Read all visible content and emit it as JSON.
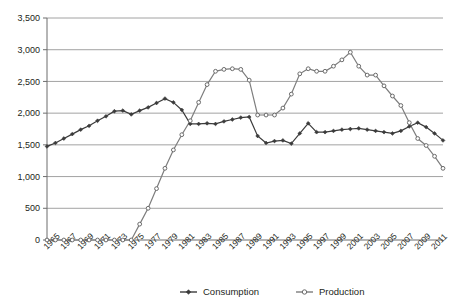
{
  "chart_data": {
    "type": "line",
    "title": "",
    "xlabel": "",
    "ylabel": "",
    "grid": true,
    "legend_position": "bottom",
    "ylim": [
      0,
      3500
    ],
    "yticks": [
      0,
      500,
      1000,
      1500,
      2000,
      2500,
      3000,
      3500
    ],
    "ytick_labels": [
      "0",
      "500",
      "1,000",
      "1,500",
      "2,000",
      "2,500",
      "3,000",
      "3,500"
    ],
    "x": [
      1965,
      1966,
      1967,
      1968,
      1969,
      1970,
      1971,
      1972,
      1973,
      1974,
      1975,
      1976,
      1977,
      1978,
      1979,
      1980,
      1981,
      1982,
      1983,
      1984,
      1985,
      1986,
      1987,
      1988,
      1989,
      1990,
      1991,
      1992,
      1993,
      1994,
      1995,
      1996,
      1997,
      1998,
      1999,
      2000,
      2001,
      2002,
      2003,
      2004,
      2005,
      2006,
      2007,
      2008,
      2009,
      2010,
      2011,
      2012
    ],
    "xtick_labels": [
      "1965",
      "1967",
      "1969",
      "1971",
      "1973",
      "1975",
      "1977",
      "1979",
      "1981",
      "1983",
      "1985",
      "1987",
      "1989",
      "1991",
      "1993",
      "1995",
      "1997",
      "1999",
      "2001",
      "2003",
      "2005",
      "2007",
      "2009",
      "2011"
    ],
    "series": [
      {
        "name": "Consumption",
        "marker": "filled-diamond",
        "color": "#3b3b3b",
        "values": [
          1475,
          1530,
          1600,
          1670,
          1740,
          1800,
          1880,
          1950,
          2030,
          2040,
          1980,
          2040,
          2090,
          2160,
          2230,
          2170,
          2050,
          1830,
          1830,
          1840,
          1830,
          1870,
          1900,
          1930,
          1940,
          1640,
          1530,
          1560,
          1570,
          1520,
          1680,
          1840,
          1700,
          1700,
          1720,
          1740,
          1750,
          1760,
          1740,
          1720,
          1700,
          1680,
          1720,
          1790,
          1850,
          1780,
          1680,
          1570
        ]
      },
      {
        "name": "Production",
        "marker": "open-circle",
        "color": "#7d7d7d",
        "values": [
          0,
          0,
          0,
          0,
          0,
          0,
          0,
          0,
          0,
          0,
          0,
          250,
          500,
          810,
          1130,
          1420,
          1660,
          1880,
          2170,
          2450,
          2660,
          2690,
          2700,
          2690,
          2520,
          1970,
          1970,
          1970,
          2080,
          2300,
          2620,
          2700,
          2660,
          2660,
          2740,
          2840,
          2960,
          2740,
          2600,
          2600,
          2430,
          2270,
          2120,
          1850,
          1600,
          1490,
          1320,
          1130
        ]
      }
    ],
    "legend": [
      {
        "label": "Consumption",
        "marker": "filled-diamond"
      },
      {
        "label": "Production",
        "marker": "open-circle"
      }
    ]
  }
}
